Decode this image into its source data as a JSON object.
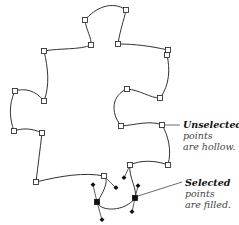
{
  "figure": {
    "type": "bezier-path-illustration"
  },
  "annotations": [
    {
      "id": "unselected",
      "lead": "Unselected",
      "lines": [
        "points",
        "are hollow."
      ]
    },
    {
      "id": "selected",
      "lead": "Selected",
      "lines": [
        "points",
        "are filled."
      ]
    }
  ],
  "colors": {
    "stroke": "#333333",
    "point_fill_selected": "#111111",
    "point_fill_unselected": "#ffffff",
    "text": "#222222"
  }
}
